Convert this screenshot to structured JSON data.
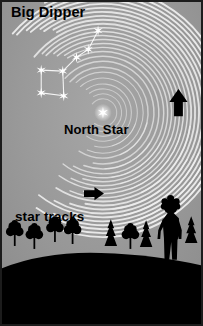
{
  "diagram": {
    "type": "astronomy-illustration",
    "labels": {
      "big_dipper": "Big Dipper",
      "north_star": "North Star",
      "star_tracks": "star tracks"
    },
    "colors": {
      "sky": "#9a9a9a",
      "ground": "#000000",
      "star_trail": "#f2f2f2",
      "star": "#ffffff",
      "text": "#000000",
      "border": "#1c1c1c",
      "arrow": "#000000"
    },
    "celestial_pole": {
      "x": 103,
      "y": 112
    },
    "north_star_marker": {
      "x": 103,
      "y": 112,
      "radius": 6
    },
    "star_trails": {
      "description": "Concentric white arcs centered on the North Star",
      "arc_count": 26,
      "radii": [
        14,
        19,
        24,
        29,
        35,
        41,
        46,
        52,
        57,
        62,
        66,
        70,
        74,
        78,
        82,
        86,
        90,
        94,
        98,
        102,
        106,
        110,
        114,
        118,
        122,
        126
      ]
    },
    "big_dipper": {
      "star_count": 7,
      "stars": [
        {
          "name": "Dubhe",
          "x": 40,
          "y": 69
        },
        {
          "name": "Merak",
          "x": 40,
          "y": 92
        },
        {
          "name": "Phecda",
          "x": 63,
          "y": 95
        },
        {
          "name": "Megrez",
          "x": 62,
          "y": 70
        },
        {
          "name": "Alioth",
          "x": 76,
          "y": 56
        },
        {
          "name": "Mizar",
          "x": 88,
          "y": 48
        },
        {
          "name": "Alkaid",
          "x": 98,
          "y": 29
        }
      ],
      "connections": [
        [
          0,
          1
        ],
        [
          1,
          2
        ],
        [
          2,
          3
        ],
        [
          3,
          0
        ],
        [
          3,
          4
        ],
        [
          4,
          5
        ],
        [
          5,
          6
        ]
      ]
    },
    "arrows": [
      {
        "name": "trail-direction-arrow-right",
        "direction": "up",
        "x": 180,
        "y": 103,
        "size": 15
      },
      {
        "name": "trail-direction-arrow-lower",
        "direction": "right",
        "x": 93,
        "y": 194,
        "size": 11
      }
    ],
    "foreground": {
      "horizon_description": "Black silhouetted hill with trees and a standing child",
      "child_figure": {
        "x": 172,
        "y": 245,
        "description": "standing child silhouette with curly hair"
      },
      "deciduous_trees": [
        {
          "x": 13,
          "y": 246
        },
        {
          "x": 33,
          "y": 249
        },
        {
          "x": 54,
          "y": 242
        },
        {
          "x": 72,
          "y": 244
        },
        {
          "x": 131,
          "y": 249
        }
      ],
      "conifer_trees": [
        {
          "x": 111,
          "y": 246
        },
        {
          "x": 147,
          "y": 247
        },
        {
          "x": 193,
          "y": 243
        }
      ]
    }
  }
}
